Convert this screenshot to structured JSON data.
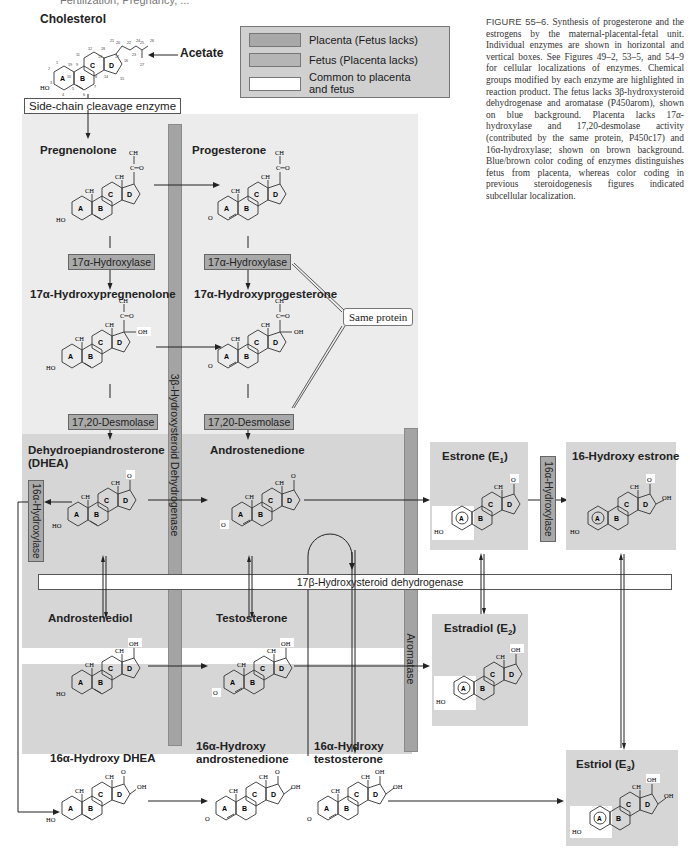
{
  "header": {
    "cut_text": "Fertilization, Pregnancy, ..."
  },
  "caption": {
    "label": "FIGURE 55–6.",
    "text": "Synthesis of progesterone and the estrogens by the maternal-placental-fetal unit. Individual enzymes are shown in horizontal and vertical boxes. See Figures 49–2, 53–5, and 54–9 for cellular localizations of enzymes. Chemical groups modified by each enzyme are highlighted in reaction product. The fetus lacks 3β-hydroxysteroid dehydrogenase and aromatase (P450arom), shown on blue background. Placenta lacks 17α-hydroxylase and 17,20-desmolase activity (contributed by the same protein, P450c17) and 16α-hydroxylase; shown on brown background. Blue/brown color coding of enzymes distinguishes fetus from placenta, whereas color coding in previous steroidogenesis figures indicated subcellular localization."
  },
  "legend": {
    "items": [
      {
        "label": "Placenta (Fetus lacks)",
        "color": "#a8a8a8"
      },
      {
        "label": "Fetus (Placenta lacks)",
        "color": "#b5b5b5"
      },
      {
        "label": "Common to placenta and fetus",
        "line1": "Common to placenta",
        "line2": "and fetus",
        "color": "#ffffff"
      }
    ]
  },
  "compounds": {
    "cholesterol": "Cholesterol",
    "acetate": "Acetate",
    "pregnenolone": "Pregnenolone",
    "progesterone": "Progesterone",
    "hydroxypregnenolone": "17α-Hydroxypregnenolone",
    "hydroxyprogesterone": "17α-Hydroxyprogesterone",
    "dhea_1": "Dehydroepiandrosterone",
    "dhea_2": "(DHEA)",
    "androstenedione": "Androstenedione",
    "androstenediol": "Androstenediol",
    "testosterone": "Testosterone",
    "estrone": "Estrone (E",
    "estrone_sub": "1",
    "hydroxy_estrone": "16-Hydroxy estrone",
    "estradiol": "Estradiol (E",
    "estradiol_sub": "2",
    "estriol": "Estriol (E",
    "estriol_sub": "3",
    "hydroxy_dhea": "16α-Hydroxy DHEA",
    "hydroxy_androstenedione_1": "16α-Hydroxy",
    "hydroxy_androstenedione_2": "androstenedione",
    "hydroxy_testosterone_1": "16α-Hydroxy",
    "hydroxy_testosterone_2": "testosterone"
  },
  "enzymes": {
    "side_chain": "Side-chain cleavage enzyme",
    "hydroxylase17_left": "17α-Hydroxylase",
    "hydroxylase17_right": "17α-Hydroxylase",
    "desmolase_left": "17,20-Desmolase",
    "desmolase_right": "17,20-Desmolase",
    "same_protein": "Same protein",
    "hsd3b": "3β-Hydroxysteroid Dehydrogenase",
    "aromatase": "Aromatase",
    "hsd17b": "17β-Hydroxysteroid dehydrogenase",
    "hydroxylase16_left": "16α-Hydroxylase",
    "hydroxylase16_right": "16α-Hydroxylase"
  },
  "atoms": {
    "ho": "HO",
    "o": "O",
    "oh": "OH",
    "ch3": "CH",
    "ch3_sub": "3",
    "co": "C═O",
    "rings": [
      "A",
      "B",
      "C",
      "D"
    ]
  },
  "colors": {
    "panel_light": "#ececec",
    "panel_dark": "#d6d6d6",
    "enzyme_gray": "#a9a9a9",
    "bar_gray": "#a4a4a4"
  }
}
